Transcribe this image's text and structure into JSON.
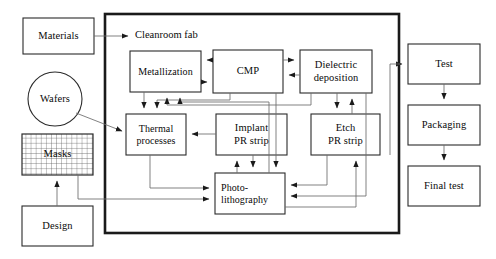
{
  "diagram": {
    "title_caption": "Cleanroom fab",
    "boundary_name": "cleanroom-fab-boundary",
    "colors": {
      "stroke": "#1a1a1a",
      "thin_stroke": "#5a5a5a",
      "boundary_stroke": "#1a1a1a",
      "background": "#ffffff",
      "text": "#0a0a0a",
      "mask_grid": "#555555"
    },
    "external_nodes": [
      {
        "id": "materials",
        "label": "Materials",
        "shape": "rect",
        "x": 23,
        "y": 18,
        "w": 71,
        "h": 36
      },
      {
        "id": "wafers",
        "label": "Wafers",
        "shape": "circle",
        "cx": 55,
        "cy": 99,
        "r": 27
      },
      {
        "id": "masks",
        "label": "Masks",
        "shape": "grid",
        "x": 22,
        "y": 134,
        "w": 71,
        "h": 41
      },
      {
        "id": "design",
        "label": "Design",
        "shape": "rect",
        "x": 22,
        "y": 206,
        "w": 71,
        "h": 40
      },
      {
        "id": "test",
        "label": "Test",
        "shape": "rect",
        "x": 408,
        "y": 44,
        "w": 72,
        "h": 40
      },
      {
        "id": "packaging",
        "label": "Packaging",
        "shape": "rect",
        "x": 408,
        "y": 105,
        "w": 72,
        "h": 40
      },
      {
        "id": "final_test",
        "label": "Final test",
        "shape": "rect",
        "x": 408,
        "y": 166,
        "w": 72,
        "h": 40
      }
    ],
    "process_nodes": [
      {
        "id": "metallization",
        "label": "Metallization",
        "x": 130,
        "y": 51,
        "w": 71,
        "h": 41
      },
      {
        "id": "cmp",
        "label": "CMP",
        "x": 213,
        "y": 50,
        "w": 70,
        "h": 43
      },
      {
        "id": "dielectric",
        "label": "Dielectric\ndeposition",
        "x": 300,
        "y": 50,
        "w": 72,
        "h": 43
      },
      {
        "id": "thermal",
        "label": "Thermal\nprocesses",
        "x": 126,
        "y": 114,
        "w": 60,
        "h": 41
      },
      {
        "id": "implant_pr_strip",
        "label": "Implant\nPR strip",
        "x": 216,
        "y": 114,
        "w": 71,
        "h": 41
      },
      {
        "id": "etch_pr_strip",
        "label": "Etch\nPR strip",
        "x": 311,
        "y": 114,
        "w": 69,
        "h": 41
      },
      {
        "id": "photolithography",
        "label": "Photo-\nlithography",
        "x": 215,
        "y": 173,
        "w": 70,
        "h": 41
      }
    ],
    "boundary": {
      "x": 105,
      "y": 14,
      "w": 294,
      "h": 219
    },
    "edges": [
      {
        "from": "materials",
        "to": "cleanroom-fab-boundary"
      },
      {
        "from": "wafers",
        "to": "thermal"
      },
      {
        "from": "design",
        "to": "masks"
      },
      {
        "from": "masks",
        "to": "photolithography"
      },
      {
        "from": "cmp",
        "to": "metallization"
      },
      {
        "from": "metallization",
        "to": "cmp"
      },
      {
        "from": "cmp",
        "to": "dielectric"
      },
      {
        "from": "dielectric",
        "to": "cmp"
      },
      {
        "from": "metallization",
        "to": "thermal"
      },
      {
        "from": "cmp",
        "to": "thermal"
      },
      {
        "from": "dielectric",
        "to": "thermal"
      },
      {
        "from": "dielectric",
        "to": "etch_pr_strip"
      },
      {
        "from": "etch_pr_strip",
        "to": "dielectric"
      },
      {
        "from": "implant_pr_strip",
        "to": "thermal"
      },
      {
        "from": "photolithography",
        "to": "implant_pr_strip"
      },
      {
        "from": "implant_pr_strip",
        "to": "photolithography"
      },
      {
        "from": "thermal",
        "to": "photolithography"
      },
      {
        "from": "photolithography",
        "to": "etch_pr_strip"
      },
      {
        "from": "etch_pr_strip",
        "to": "photolithography"
      },
      {
        "from": "photolithography",
        "to": "metallization"
      },
      {
        "from": "cleanroom-fab-boundary",
        "to": "test"
      },
      {
        "from": "test",
        "to": "packaging"
      },
      {
        "from": "packaging",
        "to": "final_test"
      }
    ]
  }
}
